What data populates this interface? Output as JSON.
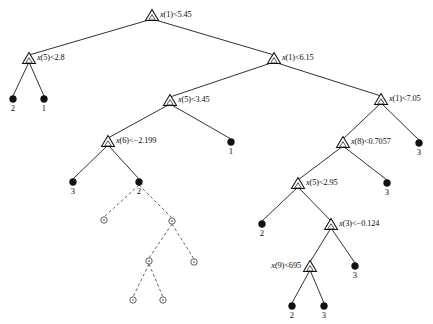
{
  "figure": {
    "width": 433,
    "height": 324,
    "background": "#ffffff",
    "line_color": "#1a1a1a",
    "dashed_line_color": "#555555",
    "leaf_fill": "#111111",
    "open_node_fill": "#ffffff"
  },
  "split_nodes": [
    {
      "id": "n0",
      "label": "x(1)<5.45",
      "var": "x",
      "arg": "(1)",
      "op": "<",
      "threshold": "5.45",
      "x": 152,
      "y": 15,
      "label_side": "right"
    },
    {
      "id": "n1",
      "label": "x(5)<2.8",
      "var": "x",
      "arg": "(5)",
      "op": "<",
      "threshold": "2.8",
      "x": 29,
      "y": 58,
      "label_side": "right"
    },
    {
      "id": "n2",
      "label": "x(1)<6.15",
      "var": "x",
      "arg": "(1)",
      "op": "<",
      "threshold": "6.15",
      "x": 274,
      "y": 58,
      "label_side": "right"
    },
    {
      "id": "n3",
      "label": "x(5)<3.45",
      "var": "x",
      "arg": "(5)",
      "op": "<",
      "threshold": "3.45",
      "x": 170,
      "y": 100,
      "label_side": "right"
    },
    {
      "id": "n4",
      "label": "x(1)<7.05",
      "var": "x",
      "arg": "(1)",
      "op": "<",
      "threshold": "7.05",
      "x": 381,
      "y": 99,
      "label_side": "right"
    },
    {
      "id": "n5",
      "label": "x(6)<−2.199",
      "var": "x",
      "arg": "(6)",
      "op": "<",
      "threshold": "−2.199",
      "x": 108,
      "y": 141,
      "label_side": "right"
    },
    {
      "id": "n6",
      "label": "x(8)<0.7057",
      "var": "x",
      "arg": "(8)",
      "op": "<",
      "threshold": "0.7057",
      "x": 343,
      "y": 142,
      "label_side": "right"
    },
    {
      "id": "n7",
      "label": "x(5)<2.95",
      "var": "x",
      "arg": "(5)",
      "op": "<",
      "threshold": "2.95",
      "x": 298,
      "y": 183,
      "label_side": "right"
    },
    {
      "id": "n8",
      "label": "x(3)<−0.124",
      "var": "x",
      "arg": "(3)",
      "op": "<",
      "threshold": "−0.124",
      "x": 331,
      "y": 224,
      "label_side": "right"
    },
    {
      "id": "n9",
      "label": "x(9)<695",
      "var": "x",
      "arg": "(9)",
      "op": "<",
      "threshold": "695",
      "x": 310,
      "y": 266,
      "label_side": "left"
    }
  ],
  "leaf_nodes": [
    {
      "id": "l0",
      "label": "2",
      "x": 13,
      "y": 99
    },
    {
      "id": "l1",
      "label": "1",
      "x": 44,
      "y": 99
    },
    {
      "id": "l2",
      "label": "1",
      "x": 231,
      "y": 142
    },
    {
      "id": "l3",
      "label": "3",
      "x": 419,
      "y": 143
    },
    {
      "id": "l4",
      "label": "3",
      "x": 73,
      "y": 182
    },
    {
      "id": "l5",
      "label": "2",
      "x": 139,
      "y": 182
    },
    {
      "id": "l6",
      "label": "3",
      "x": 387,
      "y": 183
    },
    {
      "id": "l7",
      "label": "2",
      "x": 262,
      "y": 224
    },
    {
      "id": "l8",
      "label": "3",
      "x": 355,
      "y": 266
    },
    {
      "id": "l9",
      "label": "2",
      "x": 292,
      "y": 306
    },
    {
      "id": "l10",
      "label": "3",
      "x": 324,
      "y": 306
    }
  ],
  "open_nodes": [
    {
      "id": "o0",
      "x": 104,
      "y": 220
    },
    {
      "id": "o1",
      "x": 172,
      "y": 221
    },
    {
      "id": "o2",
      "x": 149,
      "y": 261
    },
    {
      "id": "o3",
      "x": 194,
      "y": 262
    },
    {
      "id": "o4",
      "x": 133,
      "y": 300
    },
    {
      "id": "o5",
      "x": 163,
      "y": 300
    }
  ],
  "edges_solid": [
    {
      "from": "n0",
      "to": "n1",
      "x1": 152,
      "y1": 19,
      "x2": 29,
      "y2": 55
    },
    {
      "from": "n0",
      "to": "n2",
      "x1": 152,
      "y1": 19,
      "x2": 274,
      "y2": 55
    },
    {
      "from": "n1",
      "to": "l0",
      "x1": 29,
      "y1": 62,
      "x2": 13,
      "y2": 96
    },
    {
      "from": "n1",
      "to": "l1",
      "x1": 29,
      "y1": 62,
      "x2": 44,
      "y2": 96
    },
    {
      "from": "n2",
      "to": "n3",
      "x1": 274,
      "y1": 62,
      "x2": 170,
      "y2": 97
    },
    {
      "from": "n2",
      "to": "n4",
      "x1": 274,
      "y1": 62,
      "x2": 381,
      "y2": 96
    },
    {
      "from": "n3",
      "to": "n5",
      "x1": 170,
      "y1": 104,
      "x2": 108,
      "y2": 138
    },
    {
      "from": "n3",
      "to": "l2",
      "x1": 170,
      "y1": 104,
      "x2": 231,
      "y2": 139
    },
    {
      "from": "n4",
      "to": "n6",
      "x1": 381,
      "y1": 103,
      "x2": 343,
      "y2": 139
    },
    {
      "from": "n4",
      "to": "l3",
      "x1": 381,
      "y1": 103,
      "x2": 419,
      "y2": 140
    },
    {
      "from": "n5",
      "to": "l4",
      "x1": 108,
      "y1": 145,
      "x2": 73,
      "y2": 179
    },
    {
      "from": "n5",
      "to": "l5",
      "x1": 108,
      "y1": 145,
      "x2": 139,
      "y2": 179
    },
    {
      "from": "n6",
      "to": "n7",
      "x1": 343,
      "y1": 146,
      "x2": 298,
      "y2": 180
    },
    {
      "from": "n6",
      "to": "l6",
      "x1": 343,
      "y1": 146,
      "x2": 387,
      "y2": 180
    },
    {
      "from": "n7",
      "to": "l7",
      "x1": 298,
      "y1": 187,
      "x2": 262,
      "y2": 221
    },
    {
      "from": "n7",
      "to": "n8",
      "x1": 298,
      "y1": 187,
      "x2": 331,
      "y2": 221
    },
    {
      "from": "n8",
      "to": "n9",
      "x1": 331,
      "y1": 228,
      "x2": 310,
      "y2": 262
    },
    {
      "from": "n8",
      "to": "l8",
      "x1": 331,
      "y1": 228,
      "x2": 355,
      "y2": 263
    },
    {
      "from": "n9",
      "to": "l9",
      "x1": 310,
      "y1": 270,
      "x2": 292,
      "y2": 303
    },
    {
      "from": "n9",
      "to": "l10",
      "x1": 310,
      "y1": 270,
      "x2": 324,
      "y2": 303
    }
  ],
  "edges_dashed": [
    {
      "from": "l5",
      "to": "o0",
      "x1": 139,
      "y1": 185,
      "x2": 104,
      "y2": 217
    },
    {
      "from": "l5",
      "to": "o1",
      "x1": 139,
      "y1": 185,
      "x2": 172,
      "y2": 218
    },
    {
      "from": "o1",
      "to": "o2",
      "x1": 172,
      "y1": 224,
      "x2": 149,
      "y2": 258
    },
    {
      "from": "o1",
      "to": "o3",
      "x1": 172,
      "y1": 224,
      "x2": 194,
      "y2": 259
    },
    {
      "from": "o2",
      "to": "o4",
      "x1": 149,
      "y1": 264,
      "x2": 133,
      "y2": 297
    },
    {
      "from": "o2",
      "to": "o5",
      "x1": 149,
      "y1": 264,
      "x2": 163,
      "y2": 297
    }
  ]
}
